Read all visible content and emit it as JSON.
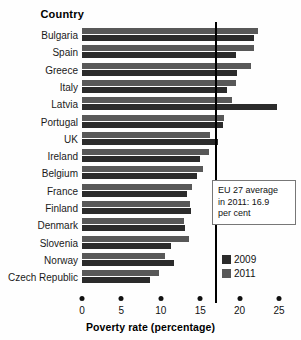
{
  "header": {
    "country_column_label": "Country"
  },
  "annotation": {
    "line1": "EU 27 average",
    "line2": "in 2011: 16.9",
    "line3": "per cent",
    "text": "EU 27 average in 2011: 16.9 per cent",
    "value": 16.9
  },
  "legend": {
    "items": [
      {
        "label": "2009",
        "color": "#2b2b2b"
      },
      {
        "label": "2011",
        "color": "#585858"
      }
    ]
  },
  "axis": {
    "ticks": [
      0,
      5,
      10,
      15,
      20,
      25
    ],
    "tick_labels": [
      "0",
      "5",
      "10",
      "15",
      "20",
      "25"
    ],
    "title": "Poverty rate (percentage)"
  },
  "chart_data": {
    "type": "bar",
    "orientation": "horizontal",
    "title": "",
    "xlabel": "Poverty rate (percentage)",
    "ylabel": "Country",
    "xlim": [
      0,
      25
    ],
    "grid": false,
    "legend_position": "bottom-right",
    "categories": [
      "Bulgaria",
      "Spain",
      "Greece",
      "Italy",
      "Latvia",
      "Portugal",
      "UK",
      "Ireland",
      "Belgium",
      "France",
      "Finland",
      "Denmark",
      "Slovenia",
      "Norway",
      "Czech Republic"
    ],
    "series": [
      {
        "name": "2009",
        "color": "#2b2b2b",
        "values": [
          21.8,
          19.5,
          19.7,
          18.4,
          24.7,
          17.9,
          17.3,
          15.0,
          14.6,
          13.3,
          13.8,
          13.1,
          11.3,
          11.7,
          8.6
        ]
      },
      {
        "name": "2011",
        "color": "#585858",
        "values": [
          22.3,
          21.8,
          21.4,
          19.6,
          19.0,
          18.0,
          16.2,
          16.1,
          15.3,
          14.0,
          13.7,
          13.0,
          13.6,
          10.5,
          9.8
        ]
      }
    ],
    "annotations": [
      {
        "type": "vline",
        "value": 16.9,
        "label": "EU 27 average in 2011: 16.9 per cent"
      }
    ]
  }
}
